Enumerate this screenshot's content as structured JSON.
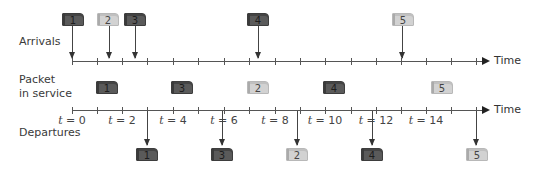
{
  "labels": {
    "arrivals": "Arrivals",
    "packet_in_service_line1": "Packet",
    "packet_in_service_line2": "in service",
    "departures": "Departures",
    "time_top": "Time",
    "time_bottom": "Time"
  },
  "time_ticks": [
    {
      "t": 0,
      "label": "t = 0"
    },
    {
      "t": 2,
      "label": "t = 2"
    },
    {
      "t": 4,
      "label": "t = 4"
    },
    {
      "t": 6,
      "label": "t = 6"
    },
    {
      "t": 8,
      "label": "t = 8"
    },
    {
      "t": 10,
      "label": "t = 10"
    },
    {
      "t": 12,
      "label": "t = 12"
    },
    {
      "t": 14,
      "label": "t = 14"
    }
  ],
  "tick_label_parts": [
    {
      "var": "t",
      "rest": " = 0"
    },
    {
      "var": "t",
      "rest": " = 2"
    },
    {
      "var": "t",
      "rest": " = 4"
    },
    {
      "var": "t",
      "rest": " = 6"
    },
    {
      "var": "t",
      "rest": " = 8"
    },
    {
      "var": "t",
      "rest": " = 10"
    },
    {
      "var": "t",
      "rest": " = 12"
    },
    {
      "var": "t",
      "rest": " = 14"
    }
  ],
  "arrivals": [
    {
      "packet": "1",
      "shade": "dark"
    },
    {
      "packet": "2",
      "shade": "light"
    },
    {
      "packet": "3",
      "shade": "dark"
    },
    {
      "packet": "4",
      "shade": "dark"
    },
    {
      "packet": "5",
      "shade": "light"
    }
  ],
  "in_service": [
    {
      "packet": "1",
      "shade": "dark"
    },
    {
      "packet": "3",
      "shade": "dark"
    },
    {
      "packet": "2",
      "shade": "light"
    },
    {
      "packet": "4",
      "shade": "dark"
    },
    {
      "packet": "5",
      "shade": "light"
    }
  ],
  "departures": [
    {
      "packet": "1",
      "shade": "dark"
    },
    {
      "packet": "3",
      "shade": "dark"
    },
    {
      "packet": "2",
      "shade": "light"
    },
    {
      "packet": "4",
      "shade": "dark"
    },
    {
      "packet": "5",
      "shade": "light"
    }
  ],
  "colors": {
    "dark_packet": "#5a5a5a",
    "light_packet": "#d2d2d2",
    "axis": "#555555",
    "text": "#333333"
  }
}
